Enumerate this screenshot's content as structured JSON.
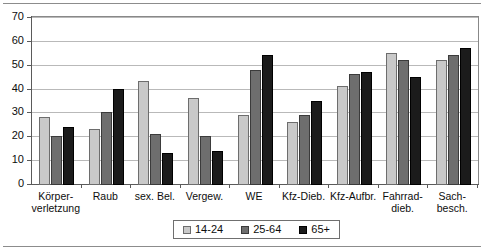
{
  "chart_data": {
    "type": "bar",
    "title": "",
    "subtitle": "",
    "xlabel": "",
    "ylabel": "",
    "ylim": [
      0,
      70
    ],
    "ytick_step": 10,
    "yticks": [
      "0",
      "10",
      "20",
      "30",
      "40",
      "50",
      "60",
      "70"
    ],
    "grid": true,
    "legend_position": "bottom-center",
    "categories": [
      "Körper-\nverletzung",
      "Raub",
      "sex. Bel.",
      "Vergew.",
      "WE",
      "Kfz-Dieb.",
      "Kfz-Aufbr.",
      "Fahrrad-\ndieb.",
      "Sach-\nbesch."
    ],
    "series": [
      {
        "name": "14-24",
        "color": "#c9c9c9",
        "values": [
          28,
          23,
          43,
          36,
          29,
          26,
          41,
          55,
          52
        ]
      },
      {
        "name": "25-64",
        "color": "#6e6e6e",
        "values": [
          20,
          30,
          21,
          20,
          48,
          29,
          46,
          52,
          54
        ]
      },
      {
        "name": "65+",
        "color": "#1b1b1b",
        "values": [
          24,
          40,
          13,
          14,
          54,
          35,
          47,
          45,
          57
        ]
      }
    ]
  },
  "legend": {
    "items": [
      {
        "label": "14-24"
      },
      {
        "label": "25-64"
      },
      {
        "label": "65+"
      }
    ]
  }
}
